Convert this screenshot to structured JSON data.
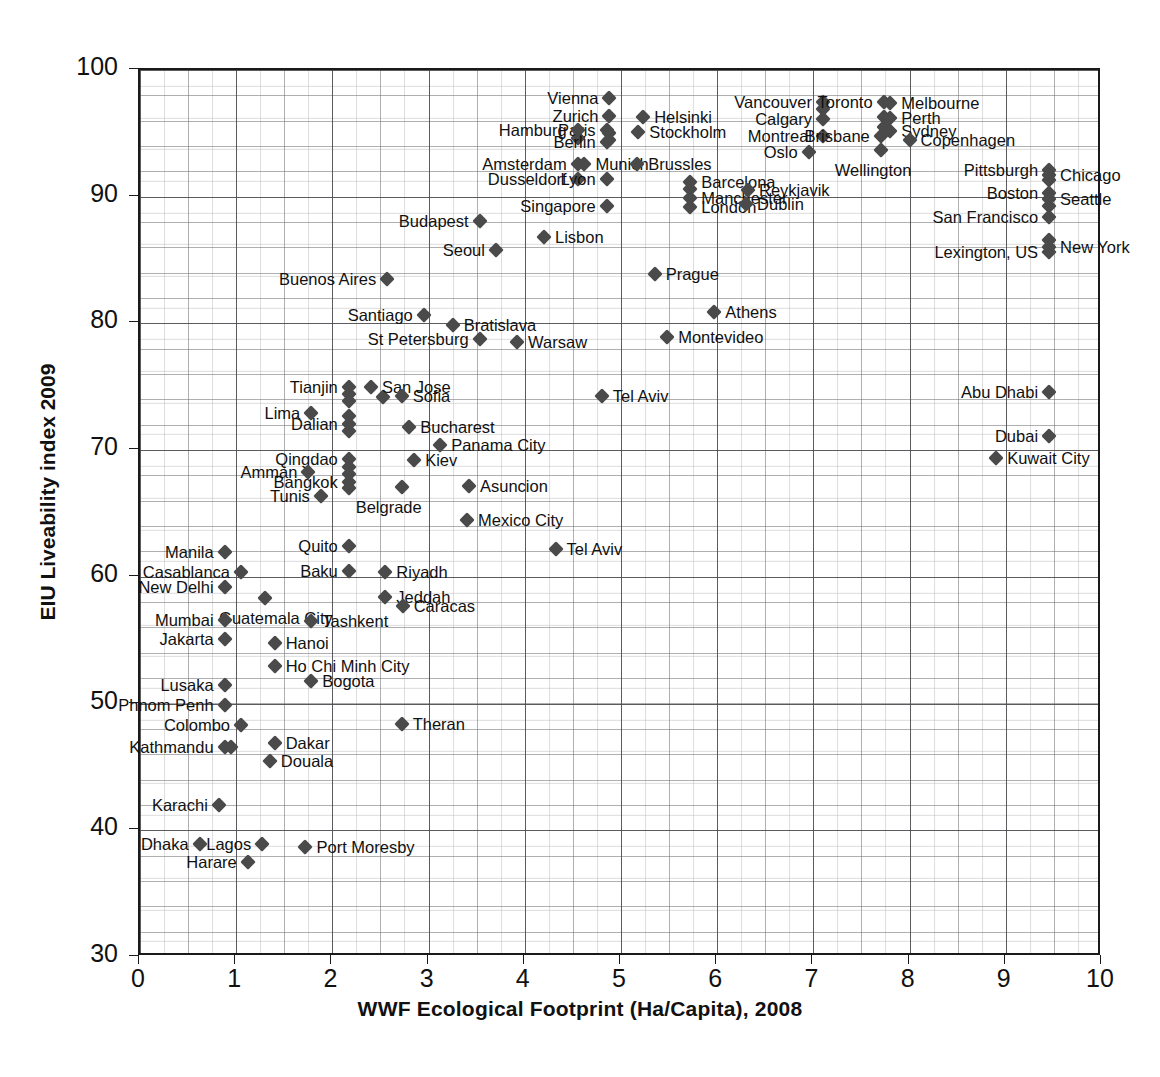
{
  "chart_data": {
    "type": "scatter",
    "title": "",
    "xlabel": "WWF Ecological Footprint (Ha/Capita), 2008",
    "ylabel": "EIU Liveability index 2009",
    "xlim": [
      0,
      10
    ],
    "ylim": [
      30,
      100
    ],
    "xticks": [
      0,
      1,
      2,
      3,
      4,
      5,
      6,
      7,
      8,
      9,
      10
    ],
    "yticks": [
      30,
      40,
      50,
      60,
      70,
      80,
      90,
      100
    ],
    "grid": true,
    "legend": null,
    "marker": "diamond",
    "marker_color": "#4a4a4a",
    "points": [
      {
        "label": "Vienna",
        "x": 4.88,
        "y": 97.8,
        "side": "left"
      },
      {
        "label": "Zurich",
        "x": 4.88,
        "y": 96.4,
        "side": "left"
      },
      {
        "label": "Helsinki",
        "x": 5.23,
        "y": 96.3,
        "side": "right"
      },
      {
        "label": "Paris",
        "x": 4.85,
        "y": 95.3,
        "side": "left"
      },
      {
        "label": "Berlin",
        "x": 4.85,
        "y": 94.3,
        "side": "left"
      },
      {
        "label": "Stockholm",
        "x": 5.18,
        "y": 95.1,
        "side": "right"
      },
      {
        "label": "Hamburg",
        "x": 4.55,
        "y": 95.3,
        "side": "left"
      },
      {
        "label": "Amsterdam",
        "x": 4.55,
        "y": 92.6,
        "side": "left"
      },
      {
        "label": "Munich",
        "x": 4.62,
        "y": 92.6,
        "side": "right"
      },
      {
        "label": "Brussles",
        "x": 5.17,
        "y": 92.6,
        "side": "right"
      },
      {
        "label": "Dusseldorf",
        "x": 4.55,
        "y": 91.4,
        "side": "left"
      },
      {
        "label": "Lyon",
        "x": 4.85,
        "y": 91.4,
        "side": "left"
      },
      {
        "label": "Barcelona",
        "x": 5.72,
        "y": 91.2,
        "side": "right"
      },
      {
        "label": "Manchester",
        "x": 5.72,
        "y": 89.9,
        "side": "right"
      },
      {
        "label": "London",
        "x": 5.72,
        "y": 89.2,
        "side": "right"
      },
      {
        "label": "Reykjavik",
        "x": 6.32,
        "y": 90.5,
        "side": "right"
      },
      {
        "label": "Dublin",
        "x": 6.3,
        "y": 89.4,
        "side": "right"
      },
      {
        "label": "Budapest",
        "x": 3.53,
        "y": 88.1,
        "side": "left"
      },
      {
        "label": "Singapore",
        "x": 4.85,
        "y": 89.3,
        "side": "left"
      },
      {
        "label": "Lisbon",
        "x": 4.2,
        "y": 86.8,
        "side": "right"
      },
      {
        "label": "Seoul",
        "x": 3.7,
        "y": 85.8,
        "side": "left"
      },
      {
        "label": "Buenos Aires",
        "x": 2.57,
        "y": 83.5,
        "side": "left"
      },
      {
        "label": "Prague",
        "x": 5.35,
        "y": 83.9,
        "side": "right"
      },
      {
        "label": "Athens",
        "x": 5.97,
        "y": 80.9,
        "side": "right"
      },
      {
        "label": "Santiago",
        "x": 2.95,
        "y": 80.7,
        "side": "left"
      },
      {
        "label": "Bratislava",
        "x": 3.25,
        "y": 79.9,
        "side": "right"
      },
      {
        "label": "St Petersburg",
        "x": 3.53,
        "y": 78.8,
        "side": "left"
      },
      {
        "label": "Warsaw",
        "x": 3.92,
        "y": 78.5,
        "side": "right"
      },
      {
        "label": "Montevideo",
        "x": 5.48,
        "y": 78.9,
        "side": "right"
      },
      {
        "label": "Vancouver",
        "x": 7.1,
        "y": 97.5,
        "side": "left"
      },
      {
        "label": "Calgary",
        "x": 7.1,
        "y": 96.1,
        "side": "left"
      },
      {
        "label": "Toronto",
        "x": 7.73,
        "y": 97.5,
        "side": "left"
      },
      {
        "label": "Melbourne",
        "x": 7.8,
        "y": 97.4,
        "side": "right"
      },
      {
        "label": "Perth",
        "x": 7.8,
        "y": 96.2,
        "side": "right"
      },
      {
        "label": "Sydney",
        "x": 7.8,
        "y": 95.2,
        "side": "right"
      },
      {
        "label": "Montreal",
        "x": 7.1,
        "y": 94.8,
        "side": "left"
      },
      {
        "label": "Brisbane",
        "x": 7.7,
        "y": 94.8,
        "side": "left"
      },
      {
        "label": "Copenhagen",
        "x": 8.0,
        "y": 94.5,
        "side": "right"
      },
      {
        "label": "Oslo",
        "x": 6.95,
        "y": 93.5,
        "side": "left"
      },
      {
        "label": "Wellington",
        "x": 7.7,
        "y": 93.7,
        "side": "below"
      },
      {
        "label": "Pittsburgh",
        "x": 9.45,
        "y": 92.1,
        "side": "left"
      },
      {
        "label": "Chicago",
        "x": 9.45,
        "y": 91.7,
        "side": "right"
      },
      {
        "label": "Boston",
        "x": 9.45,
        "y": 90.3,
        "side": "left"
      },
      {
        "label": "Seattle",
        "x": 9.45,
        "y": 89.8,
        "side": "right"
      },
      {
        "label": "San Francisco",
        "x": 9.45,
        "y": 88.4,
        "side": "left"
      },
      {
        "label": "New York",
        "x": 9.45,
        "y": 86.0,
        "side": "right"
      },
      {
        "label": "Lexington, US",
        "x": 9.45,
        "y": 85.6,
        "side": "left"
      },
      {
        "label": "Tianjin",
        "x": 2.17,
        "y": 75.0,
        "side": "left"
      },
      {
        "label": "San Jose",
        "x": 2.4,
        "y": 75.0,
        "side": "right"
      },
      {
        "label": "Sofia",
        "x": 2.72,
        "y": 74.3,
        "side": "right"
      },
      {
        "label": "Lima",
        "x": 1.78,
        "y": 72.9,
        "side": "left"
      },
      {
        "label": "Dalian",
        "x": 2.17,
        "y": 72.1,
        "side": "left"
      },
      {
        "label": "Bucharest",
        "x": 2.8,
        "y": 71.8,
        "side": "right"
      },
      {
        "label": "Panama City",
        "x": 3.12,
        "y": 70.4,
        "side": "right"
      },
      {
        "label": "Qingdao",
        "x": 2.17,
        "y": 69.3,
        "side": "left"
      },
      {
        "label": "Kiev",
        "x": 2.85,
        "y": 69.2,
        "side": "right"
      },
      {
        "label": "Amman",
        "x": 1.75,
        "y": 68.3,
        "side": "left"
      },
      {
        "label": "Bangkok",
        "x": 2.17,
        "y": 67.5,
        "side": "left"
      },
      {
        "label": "Asuncion",
        "x": 3.42,
        "y": 67.2,
        "side": "right"
      },
      {
        "label": "Tunis",
        "x": 1.88,
        "y": 66.4,
        "side": "left"
      },
      {
        "label": "Belgrade",
        "x": 2.72,
        "y": 67.1,
        "side": "below"
      },
      {
        "label": "Mexico City",
        "x": 3.4,
        "y": 64.5,
        "side": "right"
      },
      {
        "label": "Tel Aviv",
        "x": 4.8,
        "y": 74.3,
        "side": "right"
      },
      {
        "label": "Tel Aviv",
        "x": 4.32,
        "y": 62.2,
        "side": "right"
      },
      {
        "label": "Abu Dhabi",
        "x": 9.45,
        "y": 74.6,
        "side": "left"
      },
      {
        "label": "Dubai",
        "x": 9.45,
        "y": 71.1,
        "side": "left"
      },
      {
        "label": "Kuwait City",
        "x": 8.9,
        "y": 69.4,
        "side": "right"
      },
      {
        "label": "Manila",
        "x": 0.88,
        "y": 62.0,
        "side": "left"
      },
      {
        "label": "Quito",
        "x": 2.17,
        "y": 62.4,
        "side": "left"
      },
      {
        "label": "Casablanca",
        "x": 1.05,
        "y": 60.4,
        "side": "left"
      },
      {
        "label": "Baku",
        "x": 2.17,
        "y": 60.5,
        "side": "left"
      },
      {
        "label": "Riyadh",
        "x": 2.55,
        "y": 60.4,
        "side": "right"
      },
      {
        "label": "New Delhi",
        "x": 0.88,
        "y": 59.2,
        "side": "left"
      },
      {
        "label": "Jeddah",
        "x": 2.55,
        "y": 58.4,
        "side": "right"
      },
      {
        "label": "Caracas",
        "x": 2.73,
        "y": 57.7,
        "side": "right"
      },
      {
        "label": "Guatemala City",
        "x": 1.3,
        "y": 58.3,
        "side": "below"
      },
      {
        "label": "Mumbai",
        "x": 0.88,
        "y": 56.6,
        "side": "left"
      },
      {
        "label": "Tashkent",
        "x": 1.78,
        "y": 56.5,
        "side": "right"
      },
      {
        "label": "Jakarta",
        "x": 0.88,
        "y": 55.1,
        "side": "left"
      },
      {
        "label": "Hanoi",
        "x": 1.4,
        "y": 54.8,
        "side": "right"
      },
      {
        "label": "Ho Chi Minh City",
        "x": 1.4,
        "y": 53.0,
        "side": "right"
      },
      {
        "label": "Bogota",
        "x": 1.78,
        "y": 51.8,
        "side": "right"
      },
      {
        "label": "Lusaka",
        "x": 0.88,
        "y": 51.5,
        "side": "left"
      },
      {
        "label": "Phnom Penh",
        "x": 0.88,
        "y": 49.9,
        "side": "left"
      },
      {
        "label": "Colombo",
        "x": 1.05,
        "y": 48.3,
        "side": "left"
      },
      {
        "label": "Theran",
        "x": 2.72,
        "y": 48.4,
        "side": "right"
      },
      {
        "label": "Kathmandu",
        "x": 0.88,
        "y": 46.6,
        "side": "left"
      },
      {
        "label": "Dakar",
        "x": 1.4,
        "y": 46.9,
        "side": "right"
      },
      {
        "label": "Douala",
        "x": 1.35,
        "y": 45.5,
        "side": "right"
      },
      {
        "label": "Karachi",
        "x": 0.82,
        "y": 42.0,
        "side": "left"
      },
      {
        "label": "Dhaka",
        "x": 0.62,
        "y": 38.9,
        "side": "left"
      },
      {
        "label": "Lagos",
        "x": 1.27,
        "y": 38.9,
        "side": "left"
      },
      {
        "label": "Port Moresby",
        "x": 1.72,
        "y": 38.7,
        "side": "right"
      },
      {
        "label": "Harare",
        "x": 1.12,
        "y": 37.5,
        "side": "left"
      }
    ],
    "extra_markers": [
      {
        "x": 4.88,
        "y": 95.0
      },
      {
        "x": 4.88,
        "y": 94.5
      },
      {
        "x": 4.55,
        "y": 94.6
      },
      {
        "x": 7.1,
        "y": 96.9
      },
      {
        "x": 7.73,
        "y": 96.3
      },
      {
        "x": 7.73,
        "y": 95.5
      },
      {
        "x": 5.72,
        "y": 90.6
      },
      {
        "x": 9.45,
        "y": 91.3
      },
      {
        "x": 9.45,
        "y": 89.3
      },
      {
        "x": 9.45,
        "y": 86.6
      },
      {
        "x": 2.17,
        "y": 74.4
      },
      {
        "x": 2.17,
        "y": 73.9
      },
      {
        "x": 2.17,
        "y": 71.5
      },
      {
        "x": 2.17,
        "y": 72.7
      },
      {
        "x": 2.17,
        "y": 68.7
      },
      {
        "x": 2.17,
        "y": 68.1
      },
      {
        "x": 2.17,
        "y": 67.0
      },
      {
        "x": 2.53,
        "y": 74.2
      },
      {
        "x": 0.95,
        "y": 46.6
      }
    ]
  }
}
